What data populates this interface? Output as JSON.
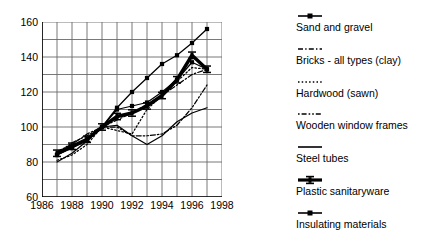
{
  "chart_data": {
    "type": "line",
    "title": "",
    "subtitle": "",
    "xlabel": "",
    "ylabel": "",
    "xlim": [
      1986,
      1998
    ],
    "ylim": [
      60,
      160
    ],
    "ytick_values": [
      60,
      80,
      100,
      120,
      140,
      160
    ],
    "ytick_labels": [
      "60",
      "80",
      "100",
      "120",
      "140",
      "160"
    ],
    "yminor_step": 10,
    "xtick_values": [
      1986,
      1988,
      1990,
      1992,
      1994,
      1996,
      1998
    ],
    "xtick_labels": [
      "1986",
      "1988",
      "1990",
      "1992",
      "1994",
      "1996",
      "1998"
    ],
    "xminor_step": 1,
    "grid": "both",
    "index_base_year": 1990,
    "index_base_value": 100,
    "legend_position": "right",
    "x": [
      1987,
      1988,
      1989,
      1990,
      1991,
      1992,
      1993,
      1994,
      1995,
      1996,
      1997
    ],
    "series": [
      {
        "name": "Sand and gravel",
        "style": "solid",
        "width": "thin",
        "marker": "square",
        "values": [
          84,
          88,
          93,
          100,
          111,
          120,
          128,
          136,
          141,
          148,
          156
        ]
      },
      {
        "name": "Bricks - all types (clay)",
        "style": "dash-dot",
        "width": "thin",
        "marker": "none",
        "values": [
          86,
          90,
          96,
          100,
          104,
          108,
          113,
          118,
          124,
          130,
          133
        ]
      },
      {
        "name": "Hardwood (sawn)",
        "style": "dotted",
        "width": "thin",
        "marker": "none",
        "values": [
          81,
          84,
          90,
          100,
          98,
          96,
          110,
          118,
          126,
          134,
          133
        ]
      },
      {
        "name": "Wooden window frames",
        "style": "dash-dot-dot",
        "width": "thin",
        "marker": "none",
        "values": [
          85,
          91,
          95,
          100,
          100,
          95,
          95,
          96,
          101,
          111,
          124
        ]
      },
      {
        "name": "Steel tubes",
        "style": "solid",
        "width": "thin",
        "marker": "none",
        "values": [
          80,
          85,
          92,
          100,
          101,
          95,
          90,
          95,
          103,
          108,
          111
        ]
      },
      {
        "name": "Plastic sanitaryware",
        "style": "solid",
        "width": "thick",
        "marker": "ibar",
        "values": [
          85,
          89,
          93,
          100,
          106,
          108,
          112,
          118,
          127,
          141,
          133
        ]
      },
      {
        "name": "Insulating materials",
        "style": "solid",
        "width": "thin",
        "marker": "square",
        "values": [
          84,
          88,
          92,
          100,
          110,
          112,
          114,
          120,
          127,
          137,
          133
        ]
      }
    ]
  },
  "legend": {
    "items": [
      {
        "label": "Sand and gravel",
        "key": "solid-thin-line-key"
      },
      {
        "label": "Bricks - all types (clay)",
        "key": "dash-dot-line-key"
      },
      {
        "label": "Hardwood (sawn)",
        "key": "dotted-line-key"
      },
      {
        "label": "Wooden window frames",
        "key": "dash-dot-dot-line-key"
      },
      {
        "label": "Steel tubes",
        "key": "solid-line-key"
      },
      {
        "label": "Plastic sanitaryware",
        "key": "ibar-marker-line-key"
      },
      {
        "label": "Insulating materials",
        "key": "square-marker-line-key"
      }
    ]
  },
  "colors": {
    "ink": "#000000",
    "grid": "#6a6a6a",
    "axis": "#000000",
    "background": "#ffffff"
  }
}
